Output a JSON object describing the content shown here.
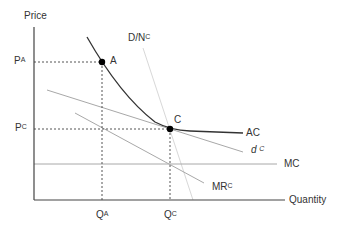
{
  "diagram": {
    "type": "economics-monopolistic-competition",
    "axes": {
      "y_label": "Price",
      "x_label": "Quantity"
    },
    "price_labels": [
      {
        "base": "P",
        "sup": "A"
      },
      {
        "base": "P",
        "sup": "C"
      }
    ],
    "quantity_labels": [
      {
        "base": "Q",
        "sup": "A"
      },
      {
        "base": "Q",
        "sup": "C"
      }
    ],
    "points": [
      {
        "label": "A"
      },
      {
        "label": "C"
      }
    ],
    "curves": {
      "demand": {
        "base": "D/N",
        "sup": "C"
      },
      "average_cost": {
        "label": "AC"
      },
      "firm_demand": {
        "base": "d",
        "sup": "C"
      },
      "marginal_cost": {
        "label": "MC"
      },
      "marginal_revenue": {
        "base": "MR",
        "sup": "C"
      }
    },
    "colors": {
      "axis": "#444444",
      "ac_curve": "#333333",
      "light_line": "#a8a8a8",
      "demand_line": "#d8d8d8",
      "dashed": "#555555",
      "point": "#000000",
      "text": "#333333"
    }
  }
}
